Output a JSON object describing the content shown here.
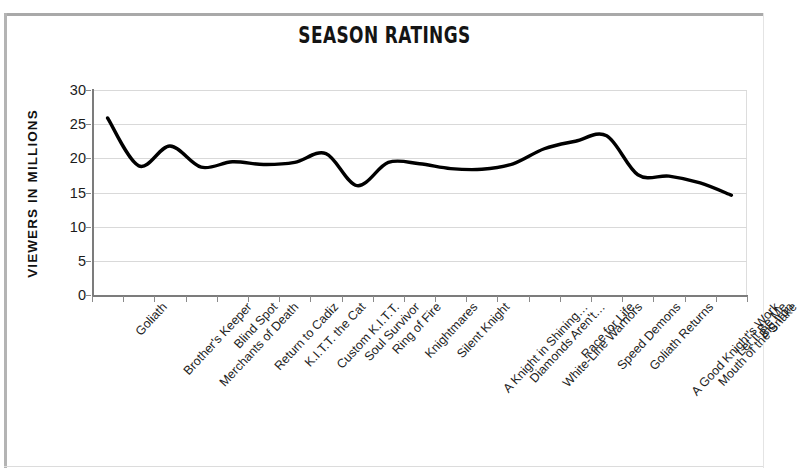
{
  "chart_data": {
    "type": "line",
    "title": "SEASON RATINGS",
    "xlabel": "",
    "ylabel": "VIEWERS IN MILLIONS",
    "ylim": [
      0,
      30
    ],
    "yticks": [
      0,
      5,
      10,
      15,
      20,
      25,
      30
    ],
    "grid": true,
    "legend": "none",
    "smoothing": "spline",
    "line_color": "#000000",
    "line_width": 3.4,
    "categories": [
      "Goliath",
      "Brother's Keeper",
      "Merchants of Death",
      "Blind Spot",
      "Return to Cadiz",
      "K.I.T.T. the Cat",
      "Custom K.I.T.T.",
      "Soul Survivor",
      "Ring of Fire",
      "Knightmares",
      "Silent Knight",
      "A Knight in Shining…",
      "Diamonds Aren't…",
      "White-Line Warriors",
      "Race for Life",
      "Speed Demons",
      "Goliath Returns",
      "A Good Knight's Work",
      "Mouth of the Snake",
      "Let It Be Me",
      "Big Iron"
    ],
    "values": [
      25.9,
      18.9,
      21.8,
      18.7,
      19.5,
      19.1,
      19.4,
      20.7,
      16.0,
      19.4,
      19.2,
      18.5,
      18.4,
      19.2,
      21.4,
      22.5,
      23.3,
      17.6,
      17.4,
      16.4,
      14.6
    ],
    "series": [
      {
        "name": "Viewers in Millions",
        "values": [
          25.9,
          18.9,
          21.8,
          18.7,
          19.5,
          19.1,
          19.4,
          20.7,
          16.0,
          19.4,
          19.2,
          18.5,
          18.4,
          19.2,
          21.4,
          22.5,
          23.3,
          17.6,
          17.4,
          16.4,
          14.6
        ]
      }
    ]
  },
  "figure": {
    "title": "SEASON RATINGS",
    "y_axis_title": "VIEWERS IN MILLIONS",
    "y_tick_labels": [
      "30",
      "25",
      "20",
      "15",
      "10",
      "5",
      "0"
    ],
    "colors": {
      "line": "#000000",
      "grid": "#d9d9d9",
      "axis": "#7c7c7c",
      "text": "#1a1a1a",
      "background": "#ffffff"
    }
  }
}
